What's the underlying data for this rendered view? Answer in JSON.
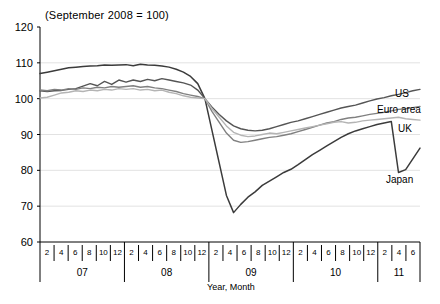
{
  "chart_data": {
    "type": "line",
    "title": "(September 2008 = 100)",
    "xlabel": "Year, Month",
    "ylabel": "",
    "ylim": [
      60,
      120
    ],
    "yticks": [
      60,
      70,
      80,
      90,
      100,
      110,
      120
    ],
    "grid": true,
    "legend_position": "right-inline",
    "x_month_ticks": [
      "2",
      "4",
      "6",
      "8",
      "10",
      "12"
    ],
    "year_groups": [
      {
        "year": "07",
        "months": [
          2,
          4,
          6,
          8,
          10,
          12
        ]
      },
      {
        "year": "08",
        "months": [
          2,
          4,
          6,
          8,
          10,
          12
        ]
      },
      {
        "year": "09",
        "months": [
          2,
          4,
          6,
          8,
          10,
          12
        ]
      },
      {
        "year": "10",
        "months": [
          2,
          4,
          6,
          8,
          10,
          12
        ]
      },
      {
        "year": "11",
        "months": [
          2,
          4,
          6
        ]
      }
    ],
    "x": [
      "07-01",
      "07-02",
      "07-03",
      "07-04",
      "07-05",
      "07-06",
      "07-07",
      "07-08",
      "07-09",
      "07-10",
      "07-11",
      "07-12",
      "08-01",
      "08-02",
      "08-03",
      "08-04",
      "08-05",
      "08-06",
      "08-07",
      "08-08",
      "08-09",
      "08-10",
      "08-11",
      "08-12",
      "09-01",
      "09-02",
      "09-03",
      "09-04",
      "09-05",
      "09-06",
      "09-07",
      "09-08",
      "09-09",
      "09-10",
      "09-11",
      "09-12",
      "10-01",
      "10-02",
      "10-03",
      "10-04",
      "10-05",
      "10-06",
      "10-07",
      "10-08",
      "10-09",
      "10-10",
      "10-11",
      "10-12",
      "11-01",
      "11-02",
      "11-03",
      "11-04",
      "11-05",
      "11-06"
    ],
    "series": [
      {
        "name": "Japan",
        "color": "#3b3b3b",
        "width": 1.5,
        "values": [
          107.0,
          107.4,
          107.8,
          108.2,
          108.6,
          108.8,
          109.0,
          109.1,
          109.2,
          109.4,
          109.3,
          109.4,
          109.5,
          109.2,
          109.6,
          109.4,
          109.3,
          109.1,
          108.8,
          108.2,
          107.4,
          106.2,
          104.2,
          100.0,
          91.0,
          82.0,
          73.0,
          68.2,
          70.5,
          72.5,
          74.0,
          75.8,
          77.0,
          78.2,
          79.4,
          80.3,
          81.6,
          83.0,
          84.4,
          85.6,
          86.8,
          88.0,
          89.2,
          90.2,
          91.0,
          91.6,
          92.2,
          92.8,
          93.2,
          93.6,
          79.4,
          80.2,
          83.2,
          86.2
        ]
      },
      {
        "name": "US",
        "color": "#555555",
        "width": 1.4,
        "values": [
          102.2,
          102.0,
          102.2,
          102.3,
          102.6,
          102.8,
          103.5,
          104.2,
          103.6,
          104.8,
          104.0,
          105.2,
          104.6,
          105.2,
          104.8,
          105.4,
          105.0,
          105.6,
          105.2,
          104.8,
          104.4,
          103.8,
          102.4,
          100.0,
          97.6,
          95.6,
          93.8,
          92.4,
          91.6,
          91.2,
          91.0,
          91.2,
          91.6,
          92.2,
          92.8,
          93.4,
          93.8,
          94.4,
          95.0,
          95.6,
          96.2,
          96.8,
          97.4,
          97.8,
          98.2,
          98.8,
          99.4,
          99.9,
          100.3,
          100.8,
          101.2,
          101.7,
          102.2,
          102.6
        ]
      },
      {
        "name": "Euro area",
        "color": "#808080",
        "width": 1.4,
        "values": [
          102.4,
          102.2,
          102.6,
          102.4,
          102.8,
          102.6,
          103.0,
          102.8,
          103.2,
          103.0,
          103.4,
          103.2,
          103.4,
          103.6,
          103.2,
          103.4,
          103.0,
          102.8,
          102.4,
          102.0,
          101.4,
          101.0,
          100.6,
          100.0,
          96.4,
          93.4,
          90.4,
          88.4,
          87.8,
          88.0,
          88.4,
          88.8,
          89.2,
          89.4,
          89.8,
          90.2,
          90.8,
          91.4,
          92.0,
          92.6,
          93.2,
          93.6,
          94.2,
          94.6,
          94.8,
          95.2,
          95.6,
          95.9,
          96.2,
          96.6,
          97.0,
          97.2,
          97.5,
          97.8
        ]
      },
      {
        "name": "UK",
        "color": "#b4b4b4",
        "width": 1.4,
        "values": [
          100.2,
          100.4,
          101.0,
          101.6,
          101.8,
          102.2,
          102.0,
          102.4,
          102.2,
          102.6,
          102.4,
          102.8,
          102.6,
          102.8,
          102.4,
          102.6,
          102.2,
          102.4,
          101.8,
          101.4,
          100.8,
          100.4,
          100.2,
          100.0,
          97.2,
          94.8,
          92.4,
          90.6,
          89.8,
          89.4,
          89.6,
          90.0,
          90.4,
          90.2,
          90.6,
          91.0,
          91.4,
          91.8,
          92.2,
          92.6,
          93.0,
          93.4,
          93.6,
          93.2,
          93.4,
          93.8,
          94.0,
          94.2,
          94.4,
          94.6,
          94.8,
          94.4,
          94.2,
          94.0
        ]
      }
    ],
    "series_labels": [
      {
        "name": "US",
        "top": 89,
        "left": 395
      },
      {
        "name": "Euro area",
        "top": 105,
        "left": 377
      },
      {
        "name": "UK",
        "top": 124,
        "left": 398
      },
      {
        "name": "Japan",
        "top": 175,
        "left": 386
      }
    ]
  }
}
